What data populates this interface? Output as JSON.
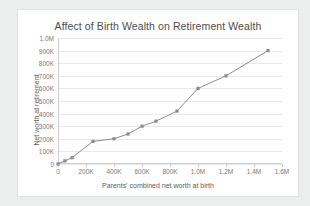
{
  "chart_data": {
    "type": "line",
    "title": "Affect of Birth Wealth on Retirement Wealth",
    "xlabel": "Parents' combined net worth at birth",
    "ylabel": "Net worth at retirement",
    "grid": true,
    "legend": "none",
    "xlim": [
      0,
      1600000
    ],
    "ylim": [
      0,
      1000000
    ],
    "xticks": [
      0,
      200000,
      400000,
      600000,
      800000,
      1000000,
      1200000,
      1400000,
      1600000
    ],
    "xtick_labels": [
      "0",
      "200K",
      "400K",
      "600K",
      "800K",
      "1.0M",
      "1.2M",
      "1.4M",
      "1.6M"
    ],
    "yticks": [
      0,
      100000,
      200000,
      300000,
      400000,
      500000,
      600000,
      700000,
      800000,
      900000,
      1000000
    ],
    "ytick_labels": [
      "0",
      "100K",
      "200K",
      "300K",
      "400K",
      "500K",
      "600K",
      "700K",
      "800K",
      "900K",
      "1.0M"
    ],
    "series": [
      {
        "name": "Retirement wealth",
        "color": "#8c8c8c",
        "marker": "square",
        "x": [
          0,
          50000,
          100000,
          250000,
          400000,
          500000,
          600000,
          700000,
          850000,
          1000000,
          1200000,
          1500000
        ],
        "y": [
          0,
          25000,
          50000,
          180000,
          200000,
          238000,
          300000,
          340000,
          420000,
          600000,
          700000,
          900000
        ]
      }
    ]
  },
  "colors": {
    "page_background": "#eceded",
    "card_background": "#ffffff",
    "gridline": "#eaeaea",
    "axis": "#cfcfcf",
    "series": "#8c8c8c",
    "title_text": "#4d4d4d",
    "tick_text": "#7a7a7a"
  }
}
